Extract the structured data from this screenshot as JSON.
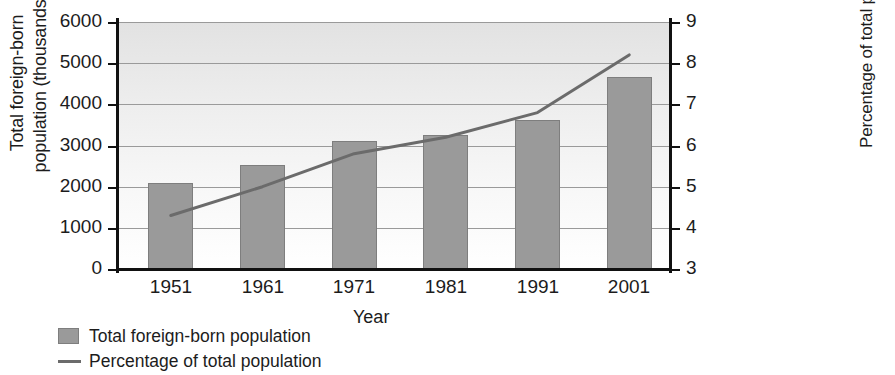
{
  "chart_data": {
    "type": "bar",
    "title": "",
    "categories": [
      "1951",
      "1961",
      "1971",
      "1981",
      "1991",
      "2001"
    ],
    "xlabel": "Year",
    "grid": true,
    "legend_position": "below-left",
    "series": [
      {
        "name": "Total foreign-born population",
        "type": "bar",
        "axis": "left",
        "color": "#9a9a9a",
        "values": [
          2100,
          2530,
          3110,
          3260,
          3620,
          4670
        ]
      },
      {
        "name": "Percentage of total population",
        "type": "line",
        "axis": "right",
        "color": "#6b6b6b",
        "values": [
          4.3,
          5.0,
          5.8,
          6.2,
          6.8,
          8.2
        ]
      }
    ],
    "left_axis": {
      "label": "Total foreign-born population (thousands)",
      "label_line1": "Total foreign-born",
      "label_line2": "population (thousands)",
      "ticks": [
        "0",
        "1000",
        "2000",
        "3000",
        "4000",
        "5000",
        "6000"
      ],
      "tick_values": [
        0,
        1000,
        2000,
        3000,
        4000,
        5000,
        6000
      ],
      "ylim": [
        0,
        6000
      ]
    },
    "right_axis": {
      "label": "Percentage of total population",
      "ticks": [
        "3",
        "4",
        "5",
        "6",
        "7",
        "8",
        "9"
      ],
      "tick_values": [
        3,
        4,
        5,
        6,
        7,
        8,
        9
      ],
      "ylim": [
        3,
        9
      ]
    }
  },
  "legend": {
    "items": [
      {
        "label": "Total foreign-born population",
        "marker": "square-swatch"
      },
      {
        "label": "Percentage of total population",
        "marker": "line-swatch"
      }
    ]
  }
}
